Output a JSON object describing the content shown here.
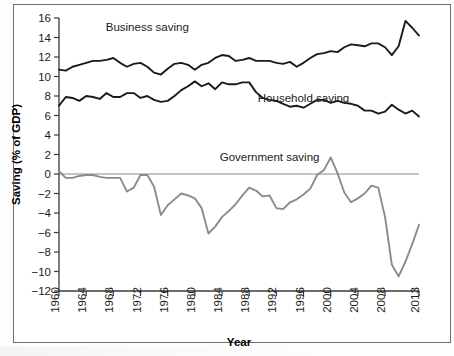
{
  "chart_data": {
    "type": "line",
    "title": "",
    "xlabel": "Year",
    "ylabel": "Saving (% of GDP)",
    "xlim": [
      1960,
      2013
    ],
    "ylim": [
      -12,
      16
    ],
    "ytick_step": 2,
    "grid": false,
    "legend_position": "inline-annotations",
    "xticks": [
      1960,
      1964,
      1968,
      1972,
      1976,
      1980,
      1984,
      1988,
      1992,
      1996,
      2000,
      2004,
      2008,
      2013
    ],
    "yticks": [
      -12,
      -10,
      -8,
      -6,
      -4,
      -2,
      0,
      2,
      4,
      6,
      8,
      10,
      12,
      14,
      16
    ],
    "zero_line": 0,
    "x": [
      1960,
      1961,
      1962,
      1963,
      1964,
      1965,
      1966,
      1967,
      1968,
      1969,
      1970,
      1971,
      1972,
      1973,
      1974,
      1975,
      1976,
      1977,
      1978,
      1979,
      1980,
      1981,
      1982,
      1983,
      1984,
      1985,
      1986,
      1987,
      1988,
      1989,
      1990,
      1991,
      1992,
      1993,
      1994,
      1995,
      1996,
      1997,
      1998,
      1999,
      2000,
      2001,
      2002,
      2003,
      2004,
      2005,
      2006,
      2007,
      2008,
      2009,
      2010,
      2011,
      2012,
      2013
    ],
    "series": [
      {
        "name": "Business saving",
        "color": "#1a1a1a",
        "values": [
          10.7,
          10.6,
          11.0,
          11.2,
          11.4,
          11.6,
          11.6,
          11.7,
          11.9,
          11.4,
          11.0,
          11.3,
          11.4,
          11.0,
          10.4,
          10.2,
          10.8,
          11.3,
          11.4,
          11.2,
          10.7,
          11.2,
          11.4,
          11.9,
          12.2,
          12.1,
          11.6,
          11.7,
          11.9,
          11.6,
          11.6,
          11.6,
          11.4,
          11.3,
          11.5,
          11.0,
          11.4,
          11.9,
          12.3,
          12.4,
          12.6,
          12.5,
          13.0,
          13.3,
          13.2,
          13.1,
          13.4,
          13.4,
          13.0,
          12.2,
          13.1,
          15.7,
          15.0,
          14.2
        ]
      },
      {
        "name": "Household saving",
        "color": "#1a1a1a",
        "values": [
          7.0,
          7.9,
          7.8,
          7.5,
          8.0,
          7.9,
          7.7,
          8.3,
          7.9,
          7.9,
          8.3,
          8.3,
          7.8,
          8.0,
          7.6,
          7.4,
          7.5,
          8.0,
          8.6,
          9.0,
          9.5,
          9.0,
          9.3,
          8.7,
          9.4,
          9.2,
          9.2,
          9.4,
          9.4,
          8.4,
          7.8,
          7.6,
          7.5,
          7.2,
          6.9,
          7.0,
          6.8,
          7.2,
          7.6,
          7.6,
          7.3,
          7.5,
          7.3,
          7.2,
          7.0,
          6.5,
          6.5,
          6.2,
          6.4,
          7.1,
          6.6,
          6.2,
          6.5,
          5.9
        ]
      },
      {
        "name": "Government saving",
        "color": "#8b8b8b",
        "values": [
          0.3,
          -0.4,
          -0.4,
          -0.2,
          -0.1,
          -0.1,
          -0.3,
          -0.4,
          -0.4,
          -0.4,
          -1.8,
          -1.4,
          -0.1,
          -0.1,
          -1.3,
          -4.2,
          -3.2,
          -2.6,
          -2.0,
          -2.2,
          -2.5,
          -3.5,
          -6.1,
          -5.4,
          -4.4,
          -3.8,
          -3.1,
          -2.2,
          -1.4,
          -1.7,
          -2.3,
          -2.2,
          -3.5,
          -3.6,
          -2.9,
          -2.6,
          -2.1,
          -1.5,
          -0.1,
          0.4,
          1.7,
          0.1,
          -1.9,
          -2.9,
          -2.5,
          -2.0,
          -1.2,
          -1.4,
          -4.4,
          -9.3,
          -10.5,
          -9.0,
          -7.2,
          -5.2
        ]
      }
    ],
    "annotations": [
      {
        "text": "Business saving",
        "x": 1973,
        "y": 14.7
      },
      {
        "text": "Household saving",
        "x": 1996,
        "y": 7.4
      },
      {
        "text": "Government saving",
        "x": 1991,
        "y": 1.3
      }
    ]
  }
}
